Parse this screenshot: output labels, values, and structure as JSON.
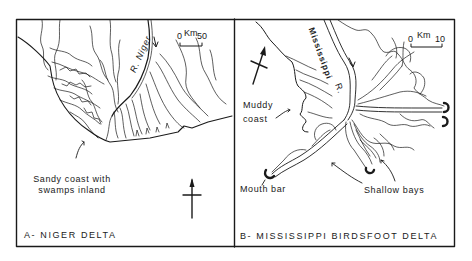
{
  "panels": [
    {
      "id": "A",
      "title": "A- NIGER  DELTA",
      "river_label": "R. Niger",
      "scale": {
        "zero": "0",
        "unit": "Km",
        "max": "50"
      },
      "annotation": {
        "line1": "Sandy coast with",
        "line2": "swamps inland"
      }
    },
    {
      "id": "B",
      "title": "B- MISSISSIPPI  BIRDSFOOT  DELTA",
      "river_label": "Mississippi",
      "river_suffix": "R.",
      "scale": {
        "zero": "0",
        "unit": "Km",
        "max": "10"
      },
      "annotations": {
        "muddy_line1": "Muddy",
        "muddy_line2": "coast",
        "mouth_bar": "Mouth bar",
        "shallow_bays": "Shallow bays"
      }
    }
  ],
  "colors": {
    "ink": "#1a1a1a",
    "background": "#ffffff"
  }
}
